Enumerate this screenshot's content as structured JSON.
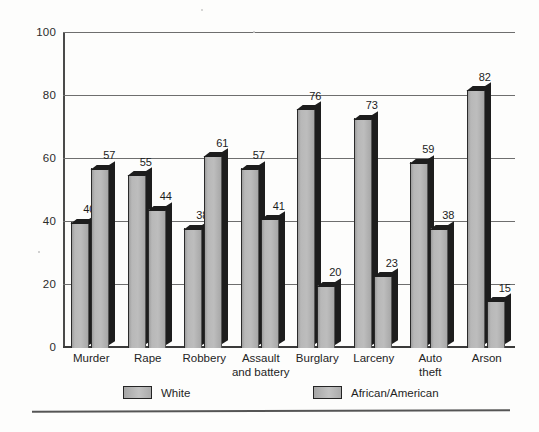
{
  "chart_data": {
    "type": "bar",
    "title": "",
    "xlabel": "",
    "ylabel": "",
    "ylim": [
      0,
      100
    ],
    "yticks": [
      0,
      20,
      40,
      60,
      80,
      100
    ],
    "grid": true,
    "legend_position": "bottom",
    "categories": [
      "Murder",
      "Rape",
      "Robbery",
      "Assault and battery",
      "Burglary",
      "Larceny",
      "Auto theft",
      "Arson"
    ],
    "category_labels": [
      [
        "Murder"
      ],
      [
        "Rape"
      ],
      [
        "Robbery"
      ],
      [
        "Assault",
        "and battery"
      ],
      [
        "Burglary"
      ],
      [
        "Larceny"
      ],
      [
        "Auto",
        "theft"
      ],
      [
        "Arson"
      ]
    ],
    "series": [
      {
        "name": "White",
        "values": [
          40,
          55,
          38,
          57,
          76,
          73,
          59,
          82
        ]
      },
      {
        "name": "African/American",
        "values": [
          57,
          44,
          61,
          41,
          20,
          23,
          38,
          15
        ]
      }
    ]
  },
  "axis": {
    "y_tick_labels": [
      "100",
      "80",
      "60",
      "40",
      "20",
      "0"
    ]
  },
  "legend": {
    "entries": [
      {
        "label": "White",
        "color": "#b0b0b0"
      },
      {
        "label": "African/American",
        "color": "#b0b0b0"
      }
    ]
  },
  "colors": {
    "bar_face": "#b0b0b0",
    "bar_shadow": "#1d1d1d",
    "gridline": "#6e6e6e",
    "axis": "#3a3a3a",
    "text": "#1c1c1c",
    "background": "#fdfdfc"
  }
}
